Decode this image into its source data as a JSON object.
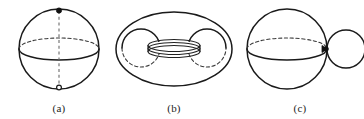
{
  "plate": {
    "background_color": "#ffffff",
    "stroke_color": "#1a1a1a",
    "dashed_stroke_color": "#3a3a3a",
    "width_px": 364,
    "height_px": 119
  },
  "figures": [
    {
      "id": "a",
      "caption": "(a)",
      "subject": "sphere-with-polar-axis",
      "markers": {
        "north_pole": "filled-dot",
        "south_pole": "open-circle",
        "axis": "dashed-vertical-line"
      },
      "equator": {
        "front_arc": "solid",
        "back_arc": "dashed"
      }
    },
    {
      "id": "b",
      "caption": "(b)",
      "subject": "torus",
      "features": {
        "outer_boundary": "solid-ellipse",
        "left_tube_circle": "solid-with-dashed-lower-arc",
        "right_tube_circle": "solid-with-dashed-lower-arc",
        "central_hole": "flattened-ellipse"
      }
    },
    {
      "id": "c",
      "caption": "(c)",
      "subject": "sphere-wedge-small-circle",
      "features": {
        "large_sphere": "solid-circle",
        "small_circle": "solid-circle",
        "tangency_point": "filled-wedge",
        "equator_front_arc": "solid",
        "equator_back_arc": "dashed"
      }
    }
  ]
}
